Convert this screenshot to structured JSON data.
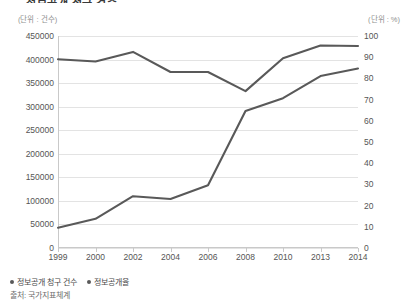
{
  "title": "정보공개 청구 건수",
  "units": {
    "left": "(단위 : 건수)",
    "right": "(단위 : %)"
  },
  "source": "출처: 국가지표체계",
  "legend": [
    {
      "label": "정보공개 청구 건수",
      "color": "#595959"
    },
    {
      "label": "정보공개율",
      "color": "#595959"
    }
  ],
  "chart_data": {
    "type": "line",
    "title": "정보공개 청구 건수",
    "xlabel": "",
    "ylabel": "건수",
    "y2label": "%",
    "grid": true,
    "legend_position": "bottom-left",
    "categories": [
      "1999",
      "2000",
      "2002",
      "2004",
      "2006",
      "2008",
      "2010",
      "2013",
      "2014"
    ],
    "ylim": [
      0,
      450000
    ],
    "yticks": [
      0,
      50000,
      100000,
      150000,
      200000,
      250000,
      300000,
      350000,
      400000,
      450000
    ],
    "y2lim": [
      0,
      100
    ],
    "y2ticks": [
      0,
      10,
      20,
      30,
      40,
      50,
      60,
      70,
      80,
      90,
      100
    ],
    "series": [
      {
        "name": "정보공개 청구 건수",
        "axis": "left",
        "color": "#595959",
        "values": [
          43000,
          62000,
          110000,
          104000,
          133000,
          291000,
          318000,
          365000,
          381000
        ]
      },
      {
        "name": "정보공개율",
        "axis": "right",
        "color": "#595959",
        "values": [
          89,
          88,
          92.5,
          83,
          83,
          74,
          89.5,
          95.5,
          95.3
        ]
      }
    ]
  }
}
